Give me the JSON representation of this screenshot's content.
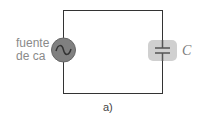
{
  "diagram": {
    "type": "circuit",
    "source_label_line1": "fuente",
    "source_label_line2": "de ca",
    "capacitor_label": "C",
    "figure_caption": "a)",
    "colors": {
      "wire": "#333333",
      "source_fill": "#808080",
      "capacitor_box": "#d0d0d0",
      "text": "#8a8a8a"
    }
  }
}
